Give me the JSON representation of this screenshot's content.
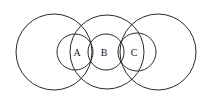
{
  "diagram": {
    "large_circles": [
      {
        "id": "left",
        "cx": 54,
        "cy": 52,
        "r": 38
      },
      {
        "id": "middle",
        "cx": 107,
        "cy": 52,
        "r": 37
      },
      {
        "id": "right",
        "cx": 158,
        "cy": 52,
        "r": 38
      }
    ],
    "small_circles": [
      {
        "id": "A",
        "cx": 75,
        "cy": 52,
        "r": 18
      },
      {
        "id": "B",
        "cx": 106,
        "cy": 52,
        "r": 18
      },
      {
        "id": "C",
        "cx": 137,
        "cy": 52,
        "r": 19
      }
    ],
    "labels": [
      {
        "text": "A",
        "x": 77,
        "y": 56
      },
      {
        "text": "B",
        "x": 104,
        "y": 56
      },
      {
        "text": "C",
        "x": 134,
        "y": 56
      }
    ],
    "stroke_color": "#2a2a2a"
  }
}
